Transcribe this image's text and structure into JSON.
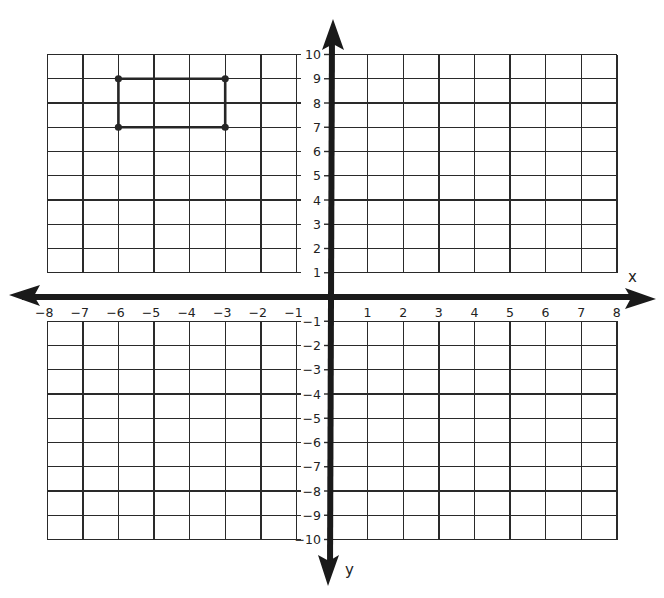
{
  "chart_data": {
    "type": "scatter",
    "title": "",
    "subtitle": "",
    "xlabel": "x",
    "ylabel": "y",
    "xlim": [
      -8,
      8
    ],
    "ylim": [
      -10,
      10
    ],
    "grid": true,
    "legend": null,
    "x_ticks": [
      -8,
      -7,
      -6,
      -5,
      -4,
      -3,
      -2,
      -1,
      1,
      2,
      3,
      4,
      5,
      6,
      7,
      8
    ],
    "y_ticks": [
      10,
      9,
      8,
      7,
      6,
      5,
      4,
      3,
      2,
      1,
      -1,
      -2,
      -3,
      -4,
      -5,
      -6,
      -7,
      -8,
      -9,
      -10
    ],
    "x_tick_labels": [
      "−8",
      "−7",
      "−6",
      "−5",
      "−4",
      "−3",
      "−2",
      "−1",
      "1",
      "2",
      "3",
      "4",
      "5",
      "6",
      "7",
      "8"
    ],
    "y_tick_labels": [
      "10",
      "9",
      "8",
      "7",
      "6",
      "5",
      "4",
      "3",
      "2",
      "1",
      "−1",
      "−2",
      "−3",
      "−4",
      "−5",
      "−6",
      "−7",
      "−8",
      "−9",
      "−10"
    ],
    "series": [
      {
        "name": "rectangle",
        "kind": "polygon",
        "closed": true,
        "points": [
          {
            "x": -6,
            "y": 9
          },
          {
            "x": -3,
            "y": 9
          },
          {
            "x": -3,
            "y": 7
          },
          {
            "x": -6,
            "y": 7
          }
        ]
      }
    ]
  },
  "axes": {
    "x_name": "x",
    "y_name": "y"
  },
  "colors": {
    "grid": "#2a2a2a",
    "axis": "#1a1a1a",
    "shape": "#262626",
    "background": "#ffffff"
  }
}
